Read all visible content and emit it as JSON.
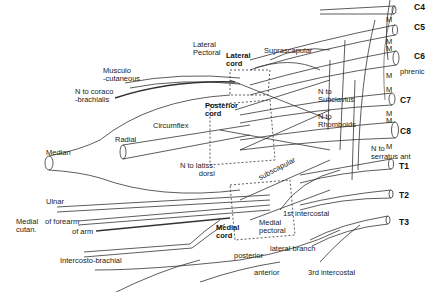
{
  "roots": [
    "C4",
    "C5",
    "C6",
    "C7",
    "C8",
    "T1",
    "T2",
    "T3"
  ],
  "cords": {
    "lateral": "Lateral\ncord",
    "posterior": "Posterior\ncord",
    "medial": "Medial\ncord"
  },
  "labels": {
    "lateral_pectoral": "Lateral\nPectoral",
    "suprascapular": "Suprascapular",
    "musculocutaneous": "Musculo\n-cutaneous",
    "n_coracobrachialis": "N to coraco\n-brachialis",
    "circumflex": "Circumflex",
    "radial": "Radial",
    "median": "Median",
    "n_latissimus": "N to latiss.\ndorsi",
    "subscapular": "subscapular",
    "n_subclavius": "N to\nSubclavius",
    "n_rhomboids": "N to\nRhomboids",
    "n_serratus": "N to\nserratus ant",
    "phrenic": "phrenic",
    "ulnar": "Ulnar",
    "medial_cutan": "Medial\ncutan.",
    "of_forearm": "of forearm",
    "of_arm": "of arm",
    "intercostobrachial": "Intercosto-brachial",
    "first_intercostal": "1st intercostal",
    "medial_pectoral": "Medial\npectoral",
    "lateral_branch": "lateral branch",
    "posterior": "posterior",
    "anterior": "anterior",
    "third_intercostal": "3rd intercostal",
    "muscle_marker": "M"
  }
}
